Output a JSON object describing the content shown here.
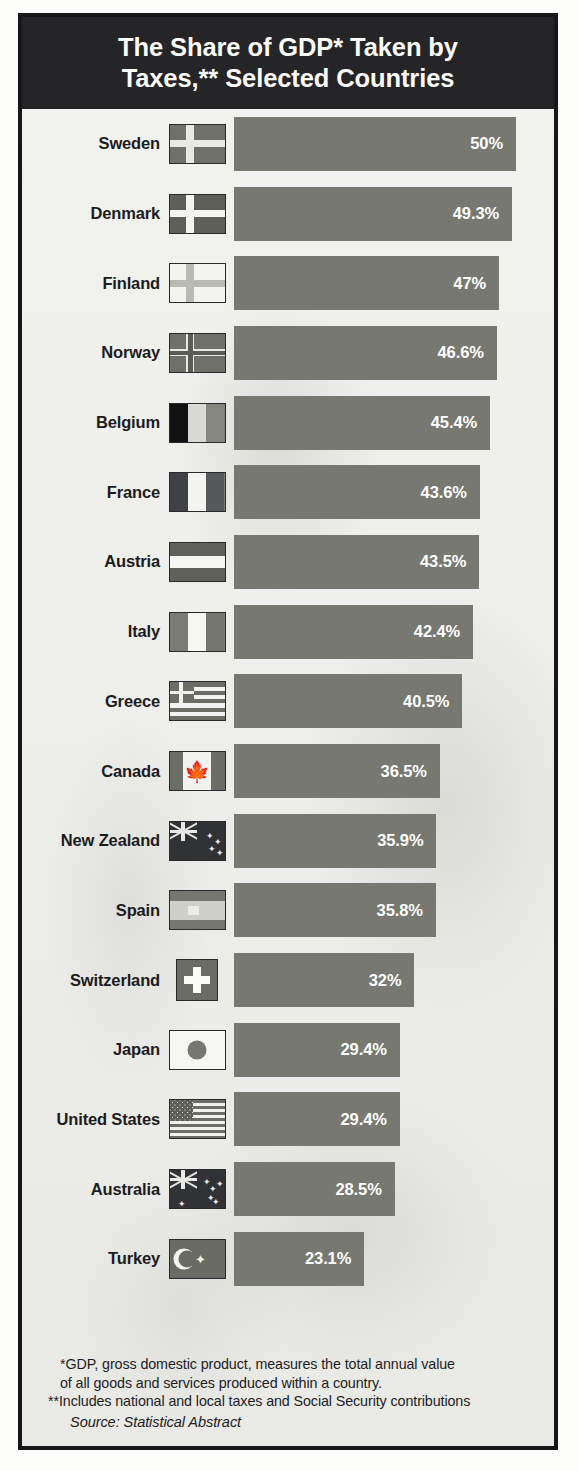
{
  "title": "The Share of GDP* Taken by Taxes,** Selected Countries",
  "title_line1": "The Share of GDP* Taken by",
  "title_line2": "Taxes,** Selected Countries",
  "footnotes": {
    "gdp_line1": "*GDP, gross domestic product, measures the total annual value",
    "gdp_line2": "of all goods and services produced within a country.",
    "taxes": "**Includes national and local taxes and Social Security contributions",
    "source": "Source: Statistical Abstract"
  },
  "colors": {
    "banner_background": "#252527",
    "banner_text": "#fbfbfa",
    "bar": "#77786f",
    "bar_label": "#ffffff",
    "page_background": "#efefec",
    "frame_border": "#18181a",
    "country_label": "#1c1c1e"
  },
  "chart_data": {
    "type": "bar",
    "orientation": "horizontal",
    "title": "The Share of GDP* Taken by Taxes,** Selected Countries",
    "xlabel": "",
    "ylabel": "",
    "unit": "%",
    "xlim": [
      0,
      50
    ],
    "grid": false,
    "legend": false,
    "categories": [
      "Sweden",
      "Denmark",
      "Finland",
      "Norway",
      "Belgium",
      "France",
      "Austria",
      "Italy",
      "Greece",
      "Canada",
      "New Zealand",
      "Spain",
      "Switzerland",
      "Japan",
      "United States",
      "Australia",
      "Turkey"
    ],
    "values": [
      50,
      49.3,
      47,
      46.6,
      45.4,
      43.6,
      43.5,
      42.4,
      40.5,
      36.5,
      35.9,
      35.8,
      32,
      29.4,
      29.4,
      28.5,
      23.1
    ],
    "value_labels": [
      "50%",
      "49.3%",
      "47%",
      "46.6%",
      "45.4%",
      "43.6%",
      "43.5%",
      "42.4%",
      "40.5%",
      "36.5%",
      "35.9%",
      "35.8%",
      "32%",
      "29.4%",
      "29.4%",
      "28.5%",
      "23.1%"
    ]
  },
  "rows": [
    {
      "country": "Sweden",
      "value": 50,
      "label": "50%",
      "flag": "flag-sweden"
    },
    {
      "country": "Denmark",
      "value": 49.3,
      "label": "49.3%",
      "flag": "flag-denmark"
    },
    {
      "country": "Finland",
      "value": 47,
      "label": "47%",
      "flag": "flag-finland"
    },
    {
      "country": "Norway",
      "value": 46.6,
      "label": "46.6%",
      "flag": "flag-norway"
    },
    {
      "country": "Belgium",
      "value": 45.4,
      "label": "45.4%",
      "flag": "flag-belgium"
    },
    {
      "country": "France",
      "value": 43.6,
      "label": "43.6%",
      "flag": "flag-france"
    },
    {
      "country": "Austria",
      "value": 43.5,
      "label": "43.5%",
      "flag": "flag-austria"
    },
    {
      "country": "Italy",
      "value": 42.4,
      "label": "42.4%",
      "flag": "flag-italy"
    },
    {
      "country": "Greece",
      "value": 40.5,
      "label": "40.5%",
      "flag": "flag-greece"
    },
    {
      "country": "Canada",
      "value": 36.5,
      "label": "36.5%",
      "flag": "flag-canada"
    },
    {
      "country": "New Zealand",
      "value": 35.9,
      "label": "35.9%",
      "flag": "flag-new-zealand"
    },
    {
      "country": "Spain",
      "value": 35.8,
      "label": "35.8%",
      "flag": "flag-spain"
    },
    {
      "country": "Switzerland",
      "value": 32,
      "label": "32%",
      "flag": "flag-switzerland"
    },
    {
      "country": "Japan",
      "value": 29.4,
      "label": "29.4%",
      "flag": "flag-japan"
    },
    {
      "country": "United States",
      "value": 29.4,
      "label": "29.4%",
      "flag": "flag-united-states"
    },
    {
      "country": "Australia",
      "value": 28.5,
      "label": "28.5%",
      "flag": "flag-australia"
    },
    {
      "country": "Turkey",
      "value": 23.1,
      "label": "23.1%",
      "flag": "flag-turkey"
    }
  ],
  "scale": {
    "max_value": 50,
    "max_bar_px": 282
  }
}
